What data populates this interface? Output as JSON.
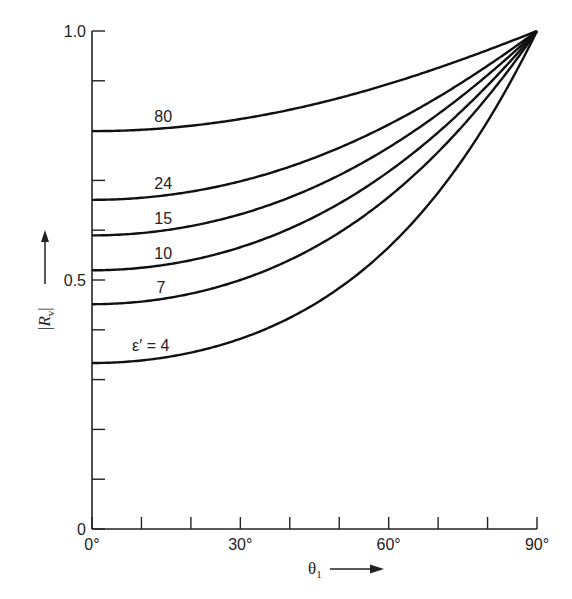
{
  "chart_data": {
    "type": "line",
    "title": "",
    "xlabel": "θ1",
    "ylabel": "|Rv|",
    "xlim": [
      0,
      90
    ],
    "ylim": [
      0,
      1.0
    ],
    "grid": false,
    "legend": "inline curve labels",
    "x_ticks": [
      0,
      10,
      20,
      30,
      40,
      50,
      60,
      70,
      80,
      90
    ],
    "x_tick_labels": [
      {
        "value": 0,
        "label": "0°"
      },
      {
        "value": 30,
        "label": "30°"
      },
      {
        "value": 60,
        "label": "60°"
      },
      {
        "value": 90,
        "label": "90°"
      }
    ],
    "y_ticks": [
      0,
      0.1,
      0.2,
      0.3,
      0.4,
      0.5,
      0.6,
      0.7,
      0.8,
      0.9,
      1.0
    ],
    "y_tick_labels": [
      {
        "value": 0,
        "label": "0"
      },
      {
        "value": 0.5,
        "label": "0.5"
      },
      {
        "value": 1.0,
        "label": "1.0"
      }
    ],
    "x": [
      0,
      15,
      30,
      45,
      60,
      75,
      90
    ],
    "series": [
      {
        "name": "80",
        "label": "80",
        "epsilon": 80,
        "values": [
          0.8,
          0.8,
          0.82,
          0.85,
          0.89,
          0.94,
          1.0
        ],
        "label_pos": [
          0.14,
          0.83
        ]
      },
      {
        "name": "24",
        "label": "24",
        "epsilon": 24,
        "values": [
          0.66,
          0.67,
          0.69,
          0.74,
          0.81,
          0.9,
          1.0
        ],
        "label_pos": [
          0.14,
          0.695
        ]
      },
      {
        "name": "15",
        "label": "15",
        "epsilon": 15,
        "values": [
          0.59,
          0.6,
          0.63,
          0.7,
          0.77,
          0.88,
          1.0
        ],
        "label_pos": [
          0.14,
          0.625
        ]
      },
      {
        "name": "10",
        "label": "10",
        "epsilon": 10,
        "values": [
          0.52,
          0.53,
          0.57,
          0.64,
          0.73,
          0.85,
          1.0
        ],
        "label_pos": [
          0.14,
          0.555
        ]
      },
      {
        "name": "7",
        "label": "7",
        "epsilon": 7,
        "values": [
          0.45,
          0.46,
          0.51,
          0.58,
          0.68,
          0.82,
          1.0
        ],
        "label_pos": [
          0.145,
          0.485
        ]
      },
      {
        "name": "ε' = 4",
        "label": "ε′ = 4",
        "epsilon": 4,
        "values": [
          0.33,
          0.35,
          0.39,
          0.47,
          0.59,
          0.76,
          1.0
        ],
        "label_pos": [
          0.09,
          0.37
        ]
      }
    ],
    "annotations": [
      "|Rv| →",
      "θ1 →"
    ]
  },
  "axes": {
    "x_title_symbol": "θ",
    "x_title_sub": "1",
    "y_title_symbol": "R",
    "y_title_sub": "v"
  },
  "colors": {
    "line": "#111111",
    "axis": "#222222",
    "background": "#ffffff"
  }
}
